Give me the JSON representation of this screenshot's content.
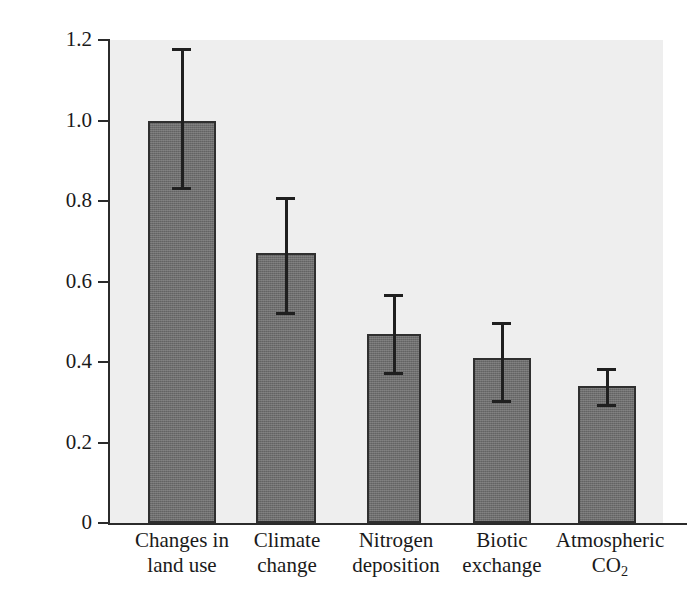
{
  "axis": {
    "y_title": "Relative effect",
    "y_ticks": [
      "1.2",
      "1.0",
      "0.8",
      "0.6",
      "0.4",
      "0.2",
      "0"
    ]
  },
  "categories": [
    {
      "line1": "Changes in",
      "line2": "land use"
    },
    {
      "line1": "Climate",
      "line2": "change"
    },
    {
      "line1": "Nitrogen",
      "line2": "deposition"
    },
    {
      "line1": "Biotic",
      "line2": "exchange"
    },
    {
      "line1": "Atmospheric",
      "line2": "CO"
    }
  ],
  "co2_subscript": "2",
  "chart_data": {
    "type": "bar",
    "title": "",
    "xlabel": "",
    "ylabel": "Relative effect",
    "ylim": [
      0,
      1.2
    ],
    "yticks": [
      0,
      0.2,
      0.4,
      0.6,
      0.8,
      1.0,
      1.2
    ],
    "grid": false,
    "legend": "none",
    "bar_color": "#6e6e6e",
    "bar_edge_color": "#2f2f2f",
    "plot_background": "#eeeeee",
    "error_bar_style": "capped vertical line, centered on bar",
    "categories": [
      "Changes in land use",
      "Climate change",
      "Nitrogen deposition",
      "Biotic exchange",
      "Atmospheric CO2"
    ],
    "values": [
      1.0,
      0.67,
      0.47,
      0.41,
      0.34
    ],
    "error_upper": [
      1.18,
      0.81,
      0.57,
      0.5,
      0.385
    ],
    "error_lower": [
      0.83,
      0.52,
      0.37,
      0.3,
      0.29
    ]
  }
}
